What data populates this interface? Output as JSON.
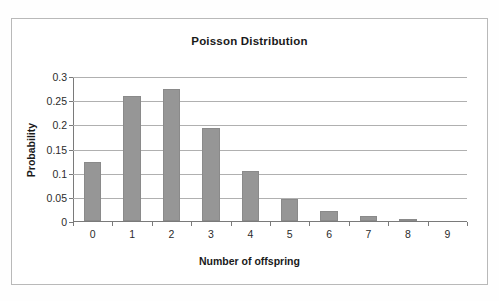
{
  "chart_data": {
    "type": "bar",
    "title": "Poisson Distribution",
    "xlabel": "Number of offspring",
    "ylabel": "Probability",
    "categories": [
      "0",
      "1",
      "2",
      "3",
      "4",
      "5",
      "6",
      "7",
      "8",
      "9"
    ],
    "values": [
      0.122,
      0.258,
      0.273,
      0.192,
      0.103,
      0.046,
      0.021,
      0.01,
      0.004,
      0.0
    ],
    "ylim": [
      0,
      0.3
    ],
    "yticks": [
      0,
      0.05,
      0.1,
      0.15,
      0.2,
      0.25,
      0.3
    ],
    "ytick_labels": [
      "0",
      "0.05",
      "0.1",
      "0.15",
      "0.2",
      "0.25",
      "0.3"
    ],
    "grid": "horizontal",
    "legend": "none",
    "series": [
      {
        "name": "Probability",
        "values": [
          0.122,
          0.258,
          0.273,
          0.192,
          0.103,
          0.046,
          0.021,
          0.01,
          0.004,
          0.0
        ]
      }
    ],
    "colors": {
      "bar_fill": "#969696",
      "bar_border": "#8a8a8a",
      "gridline": "#b0b0b0",
      "axis": "#7a7a7a",
      "chart_border": "#b9b9b9",
      "background": "#ffffff",
      "text": "#1a1a1a"
    }
  }
}
